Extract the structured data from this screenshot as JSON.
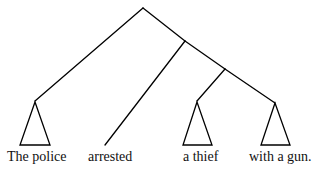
{
  "diagram": {
    "type": "syntax-tree",
    "labels": {
      "the_police": "The police",
      "arrested": "arrested",
      "a_thief": "a thief",
      "with_a_gun": "with a gun."
    },
    "stroke_color": "#000000"
  }
}
